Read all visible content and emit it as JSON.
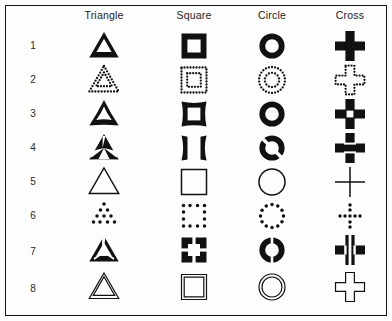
{
  "figure": {
    "title": "",
    "columns": [
      {
        "key": "triangle",
        "label": "Triangle",
        "x": 104
      },
      {
        "key": "square",
        "label": "Square",
        "x": 194
      },
      {
        "key": "circle",
        "label": "Circle",
        "x": 272
      },
      {
        "key": "cross",
        "label": "Cross",
        "x": 350
      }
    ],
    "rows": [
      {
        "number": "1",
        "style": "solid-thick-outline",
        "y": 46
      },
      {
        "number": "2",
        "style": "dotted-outline",
        "y": 80
      },
      {
        "number": "3",
        "style": "concave-thick",
        "y": 114
      },
      {
        "number": "4",
        "style": "split-pinched",
        "y": 148
      },
      {
        "number": "5",
        "style": "thin-outline",
        "y": 182
      },
      {
        "number": "6",
        "style": "sparse-dots",
        "y": 216
      },
      {
        "number": "7",
        "style": "segmented-gaps",
        "y": 250
      },
      {
        "number": "8",
        "style": "double-thin-outline",
        "y": 287
      }
    ],
    "colors": {
      "ink": "#111111",
      "background": "#fdfdfd",
      "border": "#111111",
      "label": "#1b1b1b"
    }
  },
  "chart_data": {
    "type": "table",
    "categories": [
      "Triangle",
      "Square",
      "Circle",
      "Cross"
    ],
    "row_labels": [
      "1",
      "2",
      "3",
      "4",
      "5",
      "6",
      "7",
      "8"
    ],
    "row_styles": [
      "solid thick outline",
      "dotted outline",
      "concave thick outline",
      "split / pinched outline",
      "thin outline",
      "sparse dots",
      "segmented with gaps",
      "double thin outline"
    ],
    "xlabel": "Shape",
    "ylabel": "Variant",
    "grid": false,
    "legend": "none"
  }
}
